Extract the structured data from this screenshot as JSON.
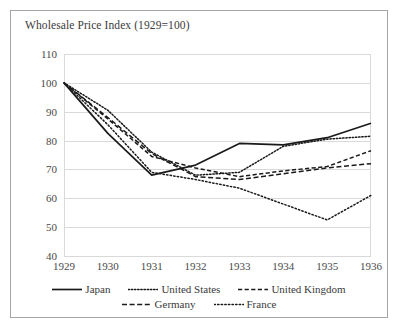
{
  "chart_data": {
    "type": "line",
    "title": "Wholesale Price Index (1929=100)",
    "xlabel": "",
    "ylabel": "",
    "x": [
      1929,
      1930,
      1931,
      1932,
      1933,
      1934,
      1935,
      1936
    ],
    "xtick_labels": [
      "1929",
      "1930",
      "1931",
      "1932",
      "1933",
      "1934",
      "1935",
      "1936"
    ],
    "ylim": [
      40,
      110
    ],
    "yticks": [
      40,
      50,
      60,
      70,
      80,
      90,
      100,
      110
    ],
    "ytick_labels": [
      "40",
      "50",
      "60",
      "70",
      "80",
      "90",
      "100",
      "110"
    ],
    "grid": true,
    "legend_position": "bottom",
    "series": [
      {
        "name": "Japan",
        "style": "solid",
        "color": "#1a1a1a",
        "values": [
          100,
          82.5,
          68.0,
          71.5,
          79.0,
          78.5,
          81.0,
          86.0
        ]
      },
      {
        "name": "United States",
        "style": "dotted",
        "color": "#1a1a1a",
        "values": [
          100,
          90.5,
          76.0,
          68.0,
          69.0,
          78.0,
          80.5,
          81.5
        ]
      },
      {
        "name": "United Kingdom",
        "style": "dashed",
        "color": "#1a1a1a",
        "values": [
          100,
          87.5,
          74.5,
          70.5,
          67.5,
          69.5,
          71.0,
          76.5
        ]
      },
      {
        "name": "Germany",
        "style": "dashed",
        "color": "#1a1a1a",
        "values": [
          100,
          88.0,
          75.5,
          67.5,
          66.5,
          68.5,
          70.5,
          72.0
        ]
      },
      {
        "name": "France",
        "style": "dotted",
        "color": "#1a1a1a",
        "values": [
          100,
          85.5,
          69.0,
          66.5,
          63.5,
          58.0,
          52.5,
          61.0
        ]
      }
    ]
  }
}
